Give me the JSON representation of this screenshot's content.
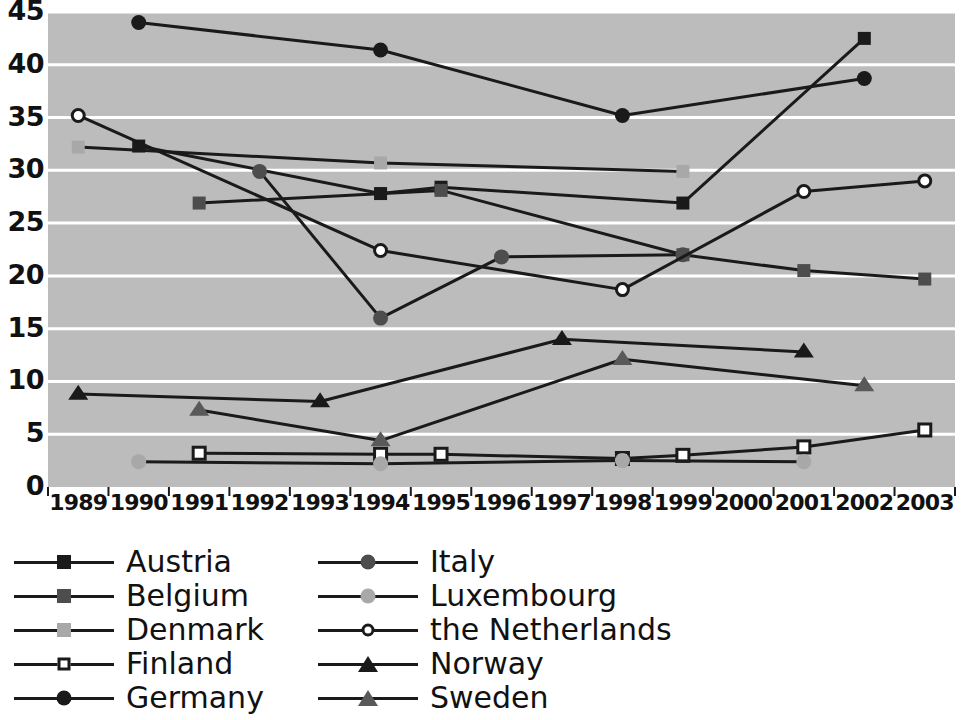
{
  "chart_data": {
    "type": "line",
    "title": "",
    "xlabel": "",
    "ylabel": "",
    "categories": [
      "1989",
      "1990",
      "1991",
      "1992",
      "1993",
      "1994",
      "1995",
      "1996",
      "1997",
      "1998",
      "1999",
      "2000",
      "2001",
      "2002",
      "2003"
    ],
    "ylim": [
      0,
      45
    ],
    "y_ticks": [
      0,
      5,
      10,
      15,
      20,
      25,
      30,
      35,
      40,
      45
    ],
    "grid": "horizontal",
    "plot_background": "#bcbcbc",
    "legend_position": "below",
    "series": [
      {
        "name": "Austria",
        "marker": "square",
        "color": "#1a1a1a",
        "filled": true,
        "points": [
          {
            "x": "1990",
            "y": 32.3
          },
          {
            "x": "1994",
            "y": 27.8
          },
          {
            "x": "1995",
            "y": 28.4
          },
          {
            "x": "1999",
            "y": 26.9
          },
          {
            "x": "2002",
            "y": 42.5
          }
        ]
      },
      {
        "name": "Belgium",
        "marker": "square",
        "color": "#4d4d4d",
        "filled": true,
        "points": [
          {
            "x": "1991",
            "y": 26.9
          },
          {
            "x": "1995",
            "y": 28.1
          },
          {
            "x": "1999",
            "y": 22.0
          },
          {
            "x": "2001",
            "y": 20.5
          },
          {
            "x": "2003",
            "y": 19.7
          }
        ]
      },
      {
        "name": "Denmark",
        "marker": "square",
        "color": "#a8a8a8",
        "filled": true,
        "points": [
          {
            "x": "1989",
            "y": 32.2
          },
          {
            "x": "1994",
            "y": 30.7
          },
          {
            "x": "1999",
            "y": 29.9
          }
        ]
      },
      {
        "name": "Finland",
        "marker": "square-open",
        "color": "#1a1a1a",
        "filled": false,
        "points": [
          {
            "x": "1991",
            "y": 3.2
          },
          {
            "x": "1994",
            "y": 3.1
          },
          {
            "x": "1995",
            "y": 3.1
          },
          {
            "x": "1998",
            "y": 2.7
          },
          {
            "x": "1999",
            "y": 3.0
          },
          {
            "x": "2001",
            "y": 3.8
          },
          {
            "x": "2003",
            "y": 5.4
          }
        ]
      },
      {
        "name": "Germany",
        "marker": "circle",
        "color": "#1a1a1a",
        "filled": true,
        "points": [
          {
            "x": "1990",
            "y": 44.0
          },
          {
            "x": "1994",
            "y": 41.4
          },
          {
            "x": "1998",
            "y": 35.2
          },
          {
            "x": "2002",
            "y": 38.7
          }
        ]
      },
      {
        "name": "Italy",
        "marker": "circle",
        "color": "#4d4d4d",
        "filled": true,
        "points": [
          {
            "x": "1992",
            "y": 29.9
          },
          {
            "x": "1994",
            "y": 16.0
          },
          {
            "x": "1996",
            "y": 21.8
          },
          {
            "x": "1999",
            "y": 22.0
          }
        ]
      },
      {
        "name": "Luxembourg",
        "marker": "circle",
        "color": "#a8a8a8",
        "filled": true,
        "points": [
          {
            "x": "1990",
            "y": 2.4
          },
          {
            "x": "1994",
            "y": 2.2
          },
          {
            "x": "1998",
            "y": 2.5
          },
          {
            "x": "2001",
            "y": 2.4
          }
        ]
      },
      {
        "name": "the Netherlands",
        "marker": "circle-open",
        "color": "#1a1a1a",
        "filled": false,
        "points": [
          {
            "x": "1989",
            "y": 35.2
          },
          {
            "x": "1994",
            "y": 22.4
          },
          {
            "x": "1998",
            "y": 18.7
          },
          {
            "x": "2001",
            "y": 28.0
          },
          {
            "x": "2003",
            "y": 29.0
          }
        ]
      },
      {
        "name": "Norway",
        "marker": "triangle",
        "color": "#1a1a1a",
        "filled": true,
        "points": [
          {
            "x": "1989",
            "y": 8.8
          },
          {
            "x": "1993",
            "y": 8.1
          },
          {
            "x": "1997",
            "y": 14.0
          },
          {
            "x": "2001",
            "y": 12.8
          }
        ]
      },
      {
        "name": "Sweden",
        "marker": "triangle",
        "color": "#595959",
        "filled": true,
        "points": [
          {
            "x": "1991",
            "y": 7.3
          },
          {
            "x": "1994",
            "y": 4.4
          },
          {
            "x": "1998",
            "y": 12.1
          },
          {
            "x": "2002",
            "y": 9.6
          }
        ]
      }
    ]
  },
  "legend": {
    "columns": [
      {
        "entries": [
          {
            "label": "Austria",
            "series": 0
          },
          {
            "label": "Belgium",
            "series": 1
          },
          {
            "label": "Denmark",
            "series": 2
          },
          {
            "label": "Finland",
            "series": 3
          },
          {
            "label": "Germany",
            "series": 4
          }
        ]
      },
      {
        "entries": [
          {
            "label": "Italy",
            "series": 5
          },
          {
            "label": "Luxembourg",
            "series": 6
          },
          {
            "label": "the Netherlands",
            "series": 7
          },
          {
            "label": "Norway",
            "series": 8
          },
          {
            "label": "Sweden",
            "series": 9
          }
        ]
      }
    ]
  }
}
